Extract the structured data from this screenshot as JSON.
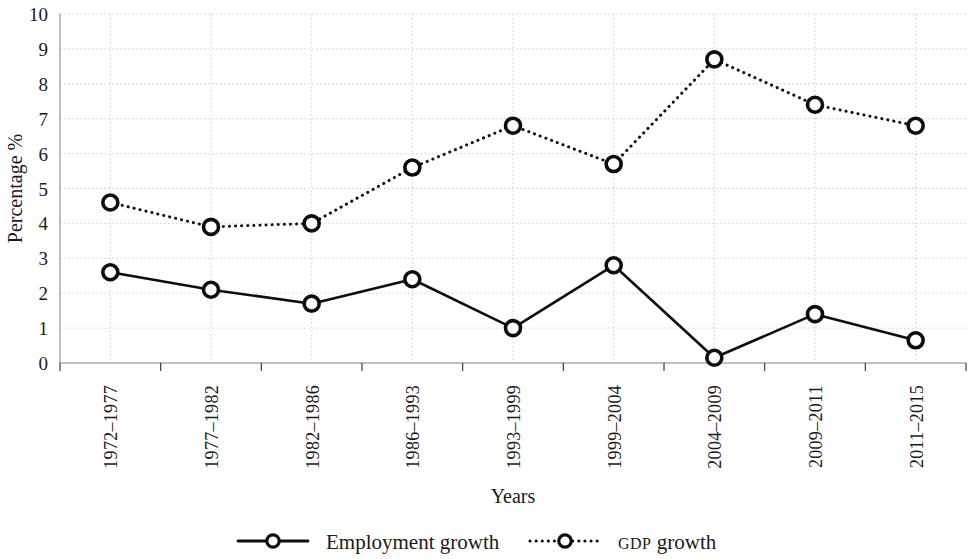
{
  "chart_data": {
    "type": "line",
    "title": "",
    "xlabel": "Years",
    "ylabel": "Percentage %",
    "categories": [
      "1972–1977",
      "1977–1982",
      "1982–1986",
      "1986–1993",
      "1993–1999",
      "1999–2004",
      "2004–2009",
      "2009–2011",
      "2011–2015"
    ],
    "series": [
      {
        "name": "Employment growth",
        "values": [
          2.6,
          2.1,
          1.7,
          2.4,
          1.0,
          2.8,
          0.15,
          1.4,
          0.65
        ],
        "line_style": "solid",
        "marker": "open-circle",
        "color": "#0d0d0d"
      },
      {
        "name": "GDP growth",
        "values": [
          4.6,
          3.9,
          4.0,
          5.6,
          6.8,
          5.7,
          8.7,
          7.4,
          6.8
        ],
        "line_style": "dotted",
        "marker": "open-circle",
        "color": "#0d0d0d"
      }
    ],
    "ylim": [
      0,
      10
    ],
    "yticks": [
      0,
      1,
      2,
      3,
      4,
      5,
      6,
      7,
      8,
      9,
      10
    ],
    "ytick_labels": [
      "0",
      "1",
      "2",
      "3",
      "4",
      "5",
      "6",
      "7",
      "8",
      "9",
      "10"
    ],
    "grid": true,
    "grid_color": "#cfcfcf",
    "legend_position": "bottom",
    "legend_entries": [
      {
        "label": "Employment growth",
        "style": "solid"
      },
      {
        "label": "GDP growth",
        "style": "dotted",
        "smallcaps_prefix": "GDP",
        "rest": " growth"
      }
    ],
    "background_color": "#ffffff",
    "axis_color": "#8a8a8a"
  }
}
